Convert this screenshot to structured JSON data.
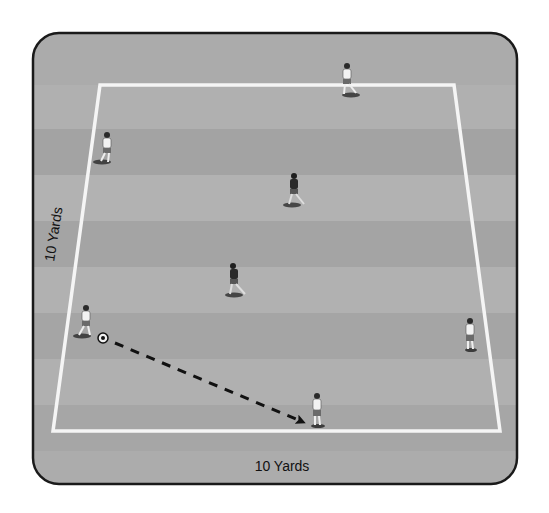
{
  "diagram": {
    "colors": {
      "background": "#ffffff",
      "panel_fill": "#a9a9a9",
      "panel_stripe_light": "#b3b3b3",
      "panel_stripe_dark": "#9d9d9d",
      "panel_border": "#1a1a1a",
      "field_line": "#f5f5f5",
      "pass_line": "#111111",
      "attacker_shirt": "#f2f2f2",
      "defender_shirt": "#2a2a2a"
    },
    "labels": {
      "side_dimension": "10 Yards",
      "bottom_dimension": "10 Yards"
    },
    "field": {
      "corners": {
        "top_left": [
          100,
          85
        ],
        "top_right": [
          454,
          85
        ],
        "bottom_right": [
          500,
          431
        ],
        "bottom_left": [
          53,
          431
        ]
      }
    },
    "players": [
      {
        "id": "attacker-top",
        "team": "attacker",
        "shirt": "white",
        "x": 347,
        "y": 80
      },
      {
        "id": "attacker-upper-left",
        "team": "attacker",
        "shirt": "white",
        "x": 106,
        "y": 148
      },
      {
        "id": "attacker-left-with-ball",
        "team": "attacker",
        "shirt": "white",
        "x": 84,
        "y": 322
      },
      {
        "id": "attacker-right",
        "team": "attacker",
        "shirt": "white",
        "x": 470,
        "y": 334
      },
      {
        "id": "attacker-bottom-receiver",
        "team": "attacker",
        "shirt": "white",
        "x": 317,
        "y": 408
      },
      {
        "id": "defender-upper",
        "team": "defender",
        "shirt": "dark",
        "x": 294,
        "y": 190
      },
      {
        "id": "defender-lower",
        "team": "defender",
        "shirt": "dark",
        "x": 234,
        "y": 280
      }
    ],
    "ball": {
      "x": 103,
      "y": 338
    },
    "pass": {
      "style": "dashed",
      "from": [
        115,
        343
      ],
      "to": [
        305,
        423
      ]
    }
  }
}
